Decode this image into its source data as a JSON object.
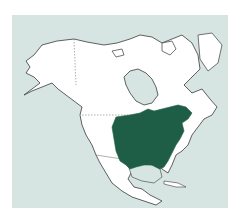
{
  "map": {
    "title": "Range map of North America",
    "region": "North America",
    "highlighted_range": "Eastern United States and southeastern Canada",
    "colors": {
      "background": "#ffffff",
      "water": "#d6e5e2",
      "land": "#ffffff",
      "outline": "#3a3a3a",
      "border": "#7a7a7a",
      "range": "#1f5e46"
    },
    "legend": []
  }
}
